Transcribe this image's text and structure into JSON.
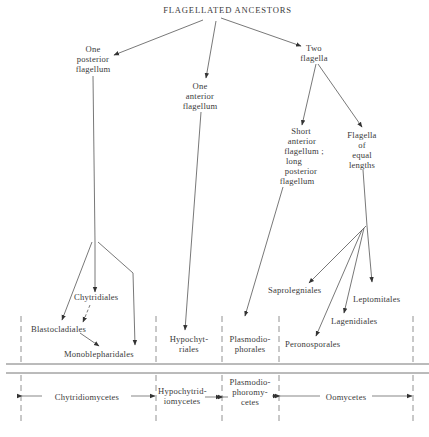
{
  "diagram": {
    "title": "FLAGELLATED ANCESTORS",
    "nodes": {
      "one_posterior": [
        "One",
        "posterior",
        "flagellum"
      ],
      "one_anterior": [
        "One",
        "anterior",
        "flagellum"
      ],
      "two_flagella": [
        "Two",
        "flagella"
      ],
      "short_anterior": [
        "Short",
        "anterior",
        "flagellum ;",
        "long",
        "posterior",
        "flagellum"
      ],
      "equal_lengths": [
        "Flagella",
        "of",
        "equal",
        "lengths"
      ]
    },
    "orders": {
      "chytridiales": "Chytridiales",
      "blastocladiales": "Blastocladiales",
      "monoblepharidales": "Monoblepharidales",
      "hypochytriales": [
        "Hypochyt-",
        "riales"
      ],
      "plasmodiophorales": [
        "Plasmodio-",
        "phorales"
      ],
      "saprolegniales": "Saprolegniales",
      "leptomitales": "Leptomitales",
      "lagenidiales": "Lagenidiales",
      "peronosporales": "Peronosporales"
    },
    "classes": {
      "chytridiomycetes": "Chytridiomycetes",
      "hypochytridiomycetes": [
        "Hypochytrid-",
        "iomycetes"
      ],
      "plasmodiophoromycetes": [
        "Plasmodio-",
        "phoromy-",
        "cetes"
      ],
      "oomycetes": "Oomycetes"
    }
  }
}
